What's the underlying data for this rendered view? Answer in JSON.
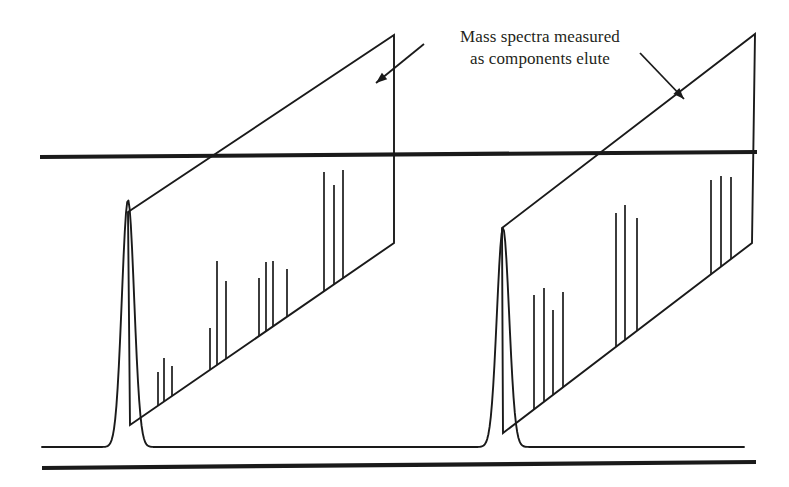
{
  "figure": {
    "title": "Mass spectra measured as components elute",
    "domain": "chromatogram-with-mass-spectra",
    "width": 789,
    "height": 487,
    "ink_color": "#1a1a1a",
    "background_color": "#ffffff"
  },
  "annotation": {
    "line1": "Mass spectra measured",
    "line2": "as components elute"
  },
  "chart_data": {
    "type": "line",
    "title": "Mass spectra measured as components elute",
    "xlabel": "",
    "ylabel": "",
    "grid": false,
    "legend": null,
    "frame_rules": [
      {
        "name": "top-rule",
        "x1": 40,
        "y1": 157,
        "x2": 757,
        "y2": 152,
        "width": 4.2
      },
      {
        "name": "bottom-rule",
        "x1": 42,
        "y1": 468,
        "x2": 756,
        "y2": 462,
        "width": 4.2
      }
    ],
    "chromatogram": {
      "baseline_y": 447,
      "start_x": 42,
      "end_x": 745,
      "peaks": [
        {
          "name": "peak-1",
          "apex_x": 128,
          "apex_y": 200,
          "half_width": 13,
          "base_y": 447
        },
        {
          "name": "peak-2",
          "apex_x": 503,
          "apex_y": 228,
          "half_width": 13,
          "base_y": 447
        }
      ]
    },
    "spectra": [
      {
        "name": "mass-spectrum-1",
        "plane": {
          "top_left": [
            128,
            212
          ],
          "top_right": [
            394,
            35
          ],
          "bottom_right": [
            394,
            243
          ],
          "bottom_left": [
            130,
            425
          ]
        },
        "baseline_from": [
          130,
          425
        ],
        "baseline_to": [
          394,
          243
        ],
        "lines": [
          {
            "x": 158,
            "top": 372
          },
          {
            "x": 164,
            "top": 358
          },
          {
            "x": 172,
            "top": 366
          },
          {
            "x": 210,
            "top": 328
          },
          {
            "x": 217,
            "top": 261
          },
          {
            "x": 226,
            "top": 281
          },
          {
            "x": 259,
            "top": 278
          },
          {
            "x": 266,
            "top": 262
          },
          {
            "x": 273,
            "top": 261
          },
          {
            "x": 287,
            "top": 269
          },
          {
            "x": 324,
            "top": 172
          },
          {
            "x": 334,
            "top": 185
          },
          {
            "x": 343,
            "top": 170
          }
        ]
      },
      {
        "name": "mass-spectrum-2",
        "plane": {
          "top_left": [
            502,
            228
          ],
          "top_right": [
            755,
            34
          ],
          "bottom_right": [
            752,
            243
          ],
          "bottom_left": [
            503,
            433
          ]
        },
        "baseline_from": [
          503,
          433
        ],
        "baseline_to": [
          752,
          243
        ],
        "lines": [
          {
            "x": 534,
            "top": 295
          },
          {
            "x": 544,
            "top": 288
          },
          {
            "x": 553,
            "top": 310
          },
          {
            "x": 563,
            "top": 292
          },
          {
            "x": 616,
            "top": 213
          },
          {
            "x": 625,
            "top": 205
          },
          {
            "x": 637,
            "top": 218
          },
          {
            "x": 711,
            "top": 180
          },
          {
            "x": 721,
            "top": 176
          },
          {
            "x": 731,
            "top": 177
          }
        ]
      }
    ],
    "arrows": [
      {
        "name": "arrow-to-spectrum-1",
        "x1": 424,
        "y1": 44,
        "x2": 376,
        "y2": 83,
        "head": "end"
      },
      {
        "name": "arrow-to-spectrum-2",
        "x1": 640,
        "y1": 53,
        "x2": 684,
        "y2": 99,
        "head": "end"
      }
    ]
  }
}
